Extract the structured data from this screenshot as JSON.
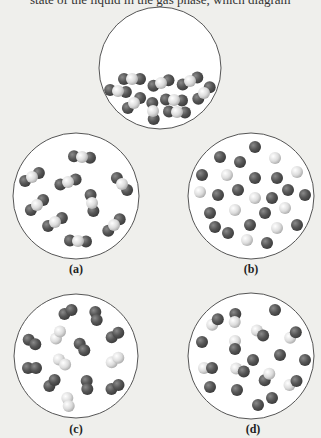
{
  "caption_fragment": "state of the liquid in the gas phase, which diagram",
  "colors": {
    "background": "#efefec",
    "circle_fill": "#ffffff",
    "circle_stroke": "#555555",
    "dark_atom": "#4f4f4f",
    "dark_atom_highlight": "#8a8a8a",
    "light_atom": "#d8d8d8",
    "light_atom_highlight": "#ffffff"
  },
  "atom_radius": 6,
  "panels": [
    {
      "id": "top",
      "label": "",
      "cx": 160,
      "cy": 68,
      "r": 61,
      "triatomics": [
        {
          "x": 132,
          "y": 79,
          "a": 0
        },
        {
          "x": 118,
          "y": 91,
          "a": 8
        },
        {
          "x": 161,
          "y": 83,
          "a": -20
        },
        {
          "x": 190,
          "y": 81,
          "a": -25
        },
        {
          "x": 204,
          "y": 93,
          "a": -45
        },
        {
          "x": 134,
          "y": 103,
          "a": -40
        },
        {
          "x": 153,
          "y": 111,
          "a": 85
        },
        {
          "x": 174,
          "y": 100,
          "a": 3
        },
        {
          "x": 177,
          "y": 112,
          "a": 3
        }
      ]
    },
    {
      "id": "a",
      "label": "(a)",
      "label_x": 76,
      "label_y": 262,
      "cx": 76,
      "cy": 196,
      "r": 63,
      "triatomics": [
        {
          "x": 82,
          "y": 157,
          "a": 5
        },
        {
          "x": 32,
          "y": 177,
          "a": -30
        },
        {
          "x": 68,
          "y": 182,
          "a": -18
        },
        {
          "x": 122,
          "y": 184,
          "a": 50
        },
        {
          "x": 92,
          "y": 203,
          "a": 80
        },
        {
          "x": 37,
          "y": 205,
          "a": -40
        },
        {
          "x": 55,
          "y": 222,
          "a": -30
        },
        {
          "x": 114,
          "y": 225,
          "a": -45
        },
        {
          "x": 78,
          "y": 241,
          "a": 3
        }
      ]
    },
    {
      "id": "b",
      "label": "(b)",
      "label_x": 251,
      "label_y": 262,
      "cx": 251,
      "cy": 196,
      "r": 63,
      "dark_atoms": [
        [
          255,
          147
        ],
        [
          220,
          157
        ],
        [
          240,
          162
        ],
        [
          202,
          175
        ],
        [
          255,
          178
        ],
        [
          277,
          178
        ],
        [
          218,
          195
        ],
        [
          238,
          190
        ],
        [
          272,
          198
        ],
        [
          288,
          190
        ],
        [
          305,
          195
        ],
        [
          210,
          213
        ],
        [
          265,
          213
        ],
        [
          215,
          227
        ],
        [
          228,
          233
        ],
        [
          250,
          225
        ],
        [
          297,
          225
        ],
        [
          267,
          243
        ]
      ],
      "light_atoms": [
        [
          275,
          158
        ],
        [
          227,
          175
        ],
        [
          297,
          172
        ],
        [
          200,
          192
        ],
        [
          255,
          198
        ],
        [
          235,
          210
        ],
        [
          285,
          208
        ],
        [
          277,
          228
        ],
        [
          247,
          240
        ]
      ]
    },
    {
      "id": "c",
      "label": "(c)",
      "label_x": 76,
      "label_y": 422,
      "cx": 76,
      "cy": 356,
      "r": 62,
      "dark_pairs": [
        {
          "x": 68,
          "y": 312,
          "a": -30
        },
        {
          "x": 96,
          "y": 316,
          "a": 80
        },
        {
          "x": 32,
          "y": 342,
          "a": 35
        },
        {
          "x": 82,
          "y": 347,
          "a": 55
        },
        {
          "x": 115,
          "y": 335,
          "a": -35
        },
        {
          "x": 32,
          "y": 368,
          "a": 0
        },
        {
          "x": 52,
          "y": 383,
          "a": -50
        },
        {
          "x": 87,
          "y": 385,
          "a": 85
        },
        {
          "x": 115,
          "y": 387,
          "a": -30
        }
      ],
      "light_pairs": [
        {
          "x": 58,
          "y": 335,
          "a": -60
        },
        {
          "x": 62,
          "y": 362,
          "a": 40
        },
        {
          "x": 115,
          "y": 360,
          "a": -35
        },
        {
          "x": 68,
          "y": 402,
          "a": 80
        }
      ]
    },
    {
      "id": "d",
      "label": "(d)",
      "label_x": 253,
      "label_y": 422,
      "cx": 251,
      "cy": 356,
      "r": 63,
      "hetero_pairs": [
        {
          "x": 215,
          "y": 322,
          "a": -45,
          "light_first": true
        },
        {
          "x": 235,
          "y": 318,
          "a": 95,
          "light_first": false
        },
        {
          "x": 260,
          "y": 333,
          "a": 40,
          "light_first": true
        },
        {
          "x": 293,
          "y": 335,
          "a": -45,
          "light_first": true
        },
        {
          "x": 235,
          "y": 345,
          "a": 90,
          "light_first": true
        },
        {
          "x": 208,
          "y": 368,
          "a": 0,
          "light_first": true
        },
        {
          "x": 240,
          "y": 370,
          "a": 20,
          "light_first": true
        },
        {
          "x": 267,
          "y": 377,
          "a": -55,
          "light_first": false
        },
        {
          "x": 293,
          "y": 383,
          "a": -30,
          "light_first": true
        }
      ],
      "dark_atoms": [
        [
          275,
          310
        ],
        [
          202,
          342
        ],
        [
          280,
          355
        ],
        [
          305,
          360
        ],
        [
          253,
          360
        ],
        [
          210,
          387
        ],
        [
          237,
          390
        ],
        [
          258,
          405
        ],
        [
          272,
          398
        ]
      ]
    }
  ]
}
